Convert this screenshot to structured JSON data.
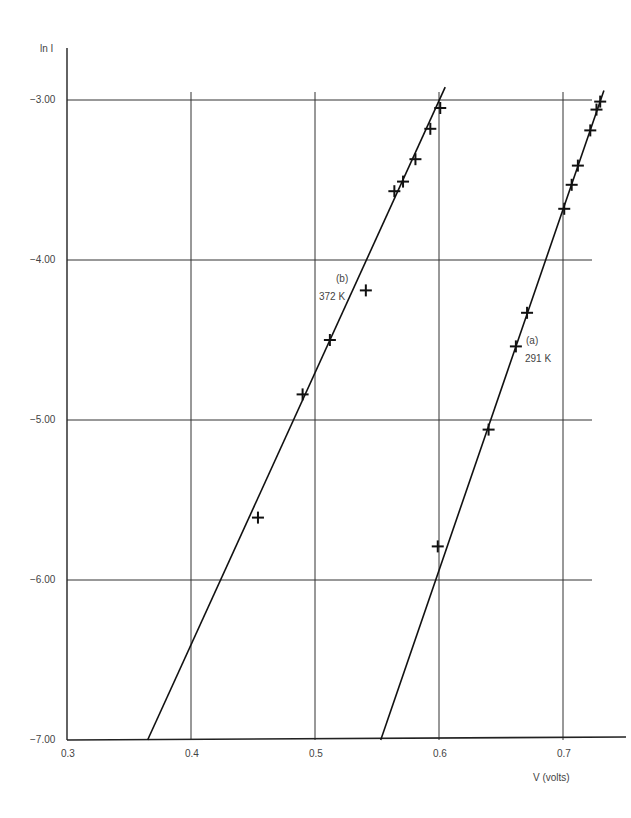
{
  "chart_data": {
    "type": "scatter",
    "title": "",
    "xlabel": "V (volts)",
    "ylabel": "ln I",
    "xlim": [
      0.3,
      0.73
    ],
    "ylim": [
      -7.0,
      -2.7
    ],
    "x_ticks": [
      "0.3",
      "0.4",
      "0.5",
      "0.6",
      "0.7"
    ],
    "y_ticks": [
      "-3.00",
      "-4.00",
      "-5.00",
      "-6.00",
      "-7.00"
    ],
    "grid": true,
    "legend": null,
    "series": [
      {
        "name": "(b) 372 K",
        "label_line1": "(b)",
        "label_line2": "372 K",
        "marker": "+",
        "points": [
          {
            "x": 0.454,
            "y": -5.61
          },
          {
            "x": 0.49,
            "y": -4.84
          },
          {
            "x": 0.512,
            "y": -4.5
          },
          {
            "x": 0.541,
            "y": -4.19
          },
          {
            "x": 0.564,
            "y": -3.57
          },
          {
            "x": 0.571,
            "y": -3.51
          },
          {
            "x": 0.581,
            "y": -3.37
          },
          {
            "x": 0.593,
            "y": -3.18
          },
          {
            "x": 0.601,
            "y": -3.05
          }
        ],
        "fit_line": {
          "x1": 0.365,
          "y1": -7.0,
          "x2": 0.605,
          "y2": -2.92
        }
      },
      {
        "name": "(a) 291 K",
        "label_line1": "(a)",
        "label_line2": "291 K",
        "marker": "+",
        "points": [
          {
            "x": 0.599,
            "y": -5.79
          },
          {
            "x": 0.64,
            "y": -5.06
          },
          {
            "x": 0.662,
            "y": -4.54
          },
          {
            "x": 0.671,
            "y": -4.33
          },
          {
            "x": 0.701,
            "y": -3.68
          },
          {
            "x": 0.707,
            "y": -3.53
          },
          {
            "x": 0.712,
            "y": -3.41
          },
          {
            "x": 0.722,
            "y": -3.19
          },
          {
            "x": 0.727,
            "y": -3.06
          },
          {
            "x": 0.73,
            "y": -3.01
          }
        ],
        "fit_line": {
          "x1": 0.553,
          "y1": -7.0,
          "x2": 0.733,
          "y2": -2.94
        }
      }
    ]
  },
  "axes": {
    "y_label": "ln I",
    "x_label": "V (volts)"
  },
  "annotations": {
    "b_line1": "(b)",
    "b_line2": "372 K",
    "a_line1": "(a)",
    "a_line2": "291 K"
  }
}
